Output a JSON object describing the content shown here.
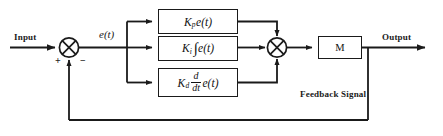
{
  "diagram": {
    "type": "control-system-block-diagram",
    "line_color": "#1a1a1a",
    "block_fill": "#ffffff"
  },
  "labels": {
    "input": "Input",
    "output": "Output",
    "error_signal": "e(t)",
    "feedback_signal": "Feedback Signal",
    "plant": "M",
    "sum1_plus": "+",
    "sum1_minus": "−"
  },
  "blocks": [
    {
      "id": "proportional",
      "name": "proportional-term-block",
      "gain": "K",
      "gain_subscript": "p",
      "operator": "",
      "signal": "e(t)",
      "full_text": "K_p e(t)"
    },
    {
      "id": "integral",
      "name": "integral-term-block",
      "gain": "K",
      "gain_subscript": "i",
      "operator": "∫",
      "signal": "e(t)",
      "full_text": "K_i ∫ e(t)"
    },
    {
      "id": "derivative",
      "name": "derivative-term-block",
      "gain": "K",
      "gain_subscript": "d",
      "operator_numerator": "d",
      "operator_denominator": "dt",
      "signal": "e(t)",
      "full_text": "K_d d/dt e(t)"
    }
  ],
  "junctions": [
    {
      "id": "sum-error",
      "name": "summing-junction-error",
      "inputs": [
        "Input",
        "Feedback Signal"
      ],
      "signs": [
        "+",
        "−"
      ],
      "output": "e(t)"
    },
    {
      "id": "sum-control",
      "name": "summing-junction-control",
      "inputs": [
        "proportional",
        "integral",
        "derivative"
      ],
      "output": "M"
    }
  ]
}
